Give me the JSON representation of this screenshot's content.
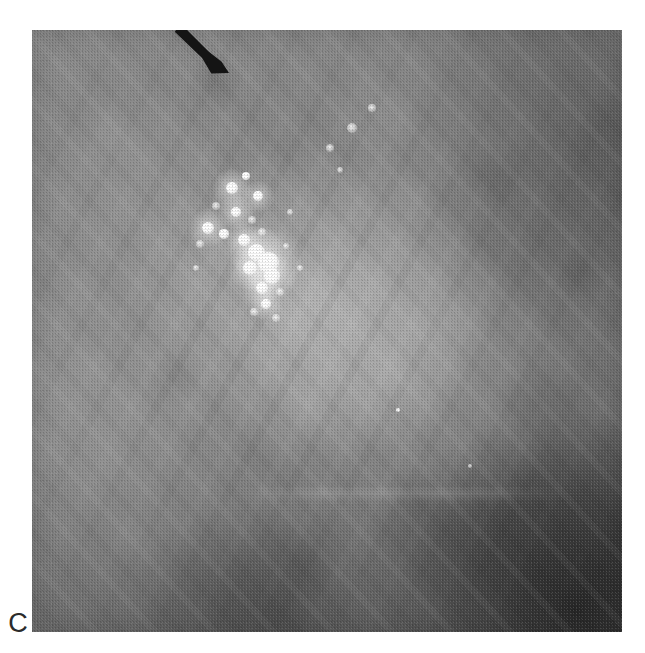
{
  "figure": {
    "panel_label": "C",
    "modality": "mammogram",
    "view_description": "magnification spot view of breast parenchyma",
    "background_color": "#ffffff"
  },
  "radiograph": {
    "x": 32,
    "y": 30,
    "width": 590,
    "height": 602,
    "base_tone_hex": "#8a8a8a",
    "darkest_region_hex": "#3a3a3a",
    "brightest_region_hex": "#ffffff",
    "regions": [
      {
        "name": "dense-central-parenchyma",
        "tone": "bright",
        "location": "center"
      },
      {
        "name": "fatty-dark-corner",
        "tone": "dark",
        "location": "bottom-right"
      },
      {
        "name": "dark-tissue-margin",
        "tone": "dark",
        "location": "top-right"
      },
      {
        "name": "fibrous-band",
        "tone": "bright",
        "location": "lower-left-diagonal"
      }
    ]
  },
  "annotations": {
    "arrow": {
      "name": "arrow-marker",
      "color_hex": "#141414",
      "tail_x": 178,
      "tail_y": 28,
      "tip_x": 229,
      "tip_y": 73,
      "direction": "down-right",
      "points_at": "microcalcification-cluster"
    },
    "panel_letter": {
      "text": "C",
      "x": 18,
      "y": 623,
      "color_hex": "#2b2b2b"
    }
  },
  "finding": {
    "name": "clustered-microcalcifications",
    "center_x": 268,
    "center_y": 262,
    "cluster_width": 130,
    "cluster_height": 175,
    "morphology": "pleomorphic clustered microcalcifications",
    "particles": [
      {
        "x": 232,
        "y": 188,
        "r": 6.0,
        "intensity": "bright"
      },
      {
        "x": 246,
        "y": 176,
        "r": 4.2,
        "intensity": "bright"
      },
      {
        "x": 258,
        "y": 196,
        "r": 5.0,
        "intensity": "bright"
      },
      {
        "x": 216,
        "y": 206,
        "r": 4.0,
        "intensity": "soft"
      },
      {
        "x": 236,
        "y": 212,
        "r": 5.4,
        "intensity": "bright"
      },
      {
        "x": 252,
        "y": 220,
        "r": 3.6,
        "intensity": "soft"
      },
      {
        "x": 208,
        "y": 228,
        "r": 6.2,
        "intensity": "bright"
      },
      {
        "x": 224,
        "y": 234,
        "r": 4.6,
        "intensity": "bright"
      },
      {
        "x": 244,
        "y": 240,
        "r": 5.8,
        "intensity": "bright"
      },
      {
        "x": 262,
        "y": 232,
        "r": 4.4,
        "intensity": "soft"
      },
      {
        "x": 200,
        "y": 244,
        "r": 3.8,
        "intensity": "soft"
      },
      {
        "x": 256,
        "y": 252,
        "r": 8.5,
        "intensity": "bright"
      },
      {
        "x": 268,
        "y": 262,
        "r": 10.5,
        "intensity": "bright"
      },
      {
        "x": 250,
        "y": 268,
        "r": 7.0,
        "intensity": "bright"
      },
      {
        "x": 272,
        "y": 276,
        "r": 7.8,
        "intensity": "bright"
      },
      {
        "x": 262,
        "y": 288,
        "r": 6.0,
        "intensity": "bright"
      },
      {
        "x": 280,
        "y": 292,
        "r": 4.4,
        "intensity": "soft"
      },
      {
        "x": 266,
        "y": 304,
        "r": 5.2,
        "intensity": "bright"
      },
      {
        "x": 254,
        "y": 312,
        "r": 3.6,
        "intensity": "soft"
      },
      {
        "x": 276,
        "y": 318,
        "r": 4.0,
        "intensity": "soft"
      },
      {
        "x": 286,
        "y": 246,
        "r": 3.4,
        "intensity": "soft"
      },
      {
        "x": 300,
        "y": 268,
        "r": 3.0,
        "intensity": "soft"
      },
      {
        "x": 196,
        "y": 268,
        "r": 3.2,
        "intensity": "soft"
      },
      {
        "x": 290,
        "y": 212,
        "r": 3.0,
        "intensity": "soft"
      },
      {
        "x": 330,
        "y": 148,
        "r": 4.0,
        "intensity": "soft"
      },
      {
        "x": 352,
        "y": 128,
        "r": 5.0,
        "intensity": "soft"
      },
      {
        "x": 340,
        "y": 170,
        "r": 3.4,
        "intensity": "soft"
      },
      {
        "x": 372,
        "y": 108,
        "r": 3.6,
        "intensity": "soft"
      },
      {
        "x": 398,
        "y": 410,
        "r": 2.2,
        "intensity": "bright"
      },
      {
        "x": 470,
        "y": 466,
        "r": 1.8,
        "intensity": "soft"
      }
    ]
  }
}
